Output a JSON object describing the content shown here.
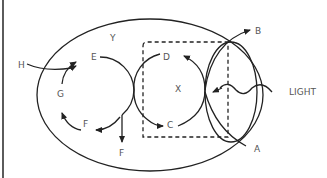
{
  "diagram": {
    "labels": {
      "Y": "Y",
      "X": "X",
      "E": "E",
      "D": "D",
      "G": "G",
      "F1": "F",
      "F2": "F",
      "C": "C",
      "H": "H",
      "B": "B",
      "A": "A",
      "light": "LIGHT"
    },
    "colors": {
      "stroke": "#222222",
      "label": "#555555",
      "background": "#ffffff"
    }
  }
}
